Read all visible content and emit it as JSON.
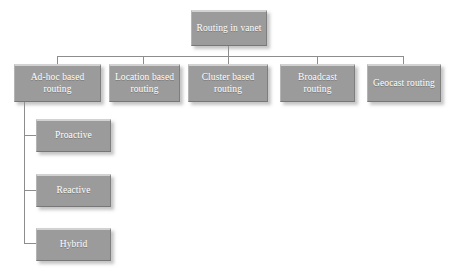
{
  "diagram": {
    "background_color": "#ffffff",
    "node_fill_color": "#9b9b9b",
    "node_text_color": "#ffffff",
    "connector_color": "#8d8d8d",
    "root": {
      "label": "Routing in vanet"
    },
    "level2": [
      {
        "label": "Ad-hoc based routing"
      },
      {
        "label": "Location based routing"
      },
      {
        "label": "Cluster based routing"
      },
      {
        "label": "Broadcast routing"
      },
      {
        "label": "Geocast routing"
      }
    ],
    "level3": [
      {
        "label": "Proactive"
      },
      {
        "label": "Reactive"
      },
      {
        "label": "Hybrid"
      }
    ]
  }
}
